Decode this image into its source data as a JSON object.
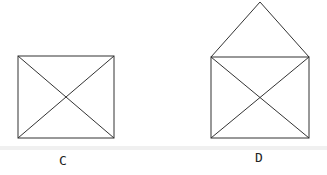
{
  "figures": [
    {
      "id": "C",
      "label": "C",
      "shape": "square-with-diagonals",
      "rect": {
        "x": 18,
        "y": 56,
        "w": 96,
        "h": 82
      }
    },
    {
      "id": "D",
      "label": "D",
      "shape": "square-with-diagonals-and-triangle-roof",
      "rect": {
        "x": 211,
        "y": 57,
        "w": 98,
        "h": 81
      },
      "apex": {
        "x": 260,
        "y": 2
      }
    }
  ],
  "colors": {
    "stroke": "#333333",
    "background": "#ffffff",
    "band": "#eeeeee"
  }
}
